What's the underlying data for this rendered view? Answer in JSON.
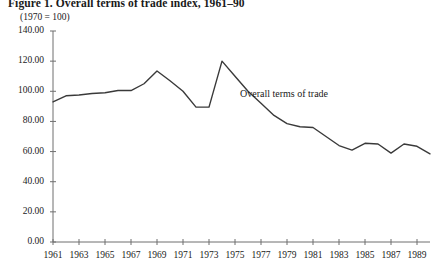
{
  "figure": {
    "title": "Figure 1.  Overall terms of trade index, 1961–90",
    "unit_note": "(1970 = 100)",
    "annotation": "Overall terms of trade",
    "line_color": "#3a3a3a",
    "axis_color": "#6f6f6f"
  },
  "chart_data": {
    "type": "line",
    "title": "Figure 1.  Overall terms of trade index, 1961–90",
    "subtitle": "(1970 = 100)",
    "xlabel": "",
    "ylabel": "",
    "ylim": [
      0,
      140
    ],
    "xlim": [
      1961,
      1990
    ],
    "grid": false,
    "legend": "inline-annotation",
    "legend_position": "center-right",
    "ytick_labels": [
      "0.00",
      "20.00",
      "40.00",
      "60.00",
      "80.00",
      "100.00",
      "120.00",
      "140.00"
    ],
    "ytick_values": [
      0,
      20,
      40,
      60,
      80,
      100,
      120,
      140
    ],
    "xtick_labels": [
      "1961",
      "1963",
      "1965",
      "1967",
      "1969",
      "1971",
      "1973",
      "1975",
      "1977",
      "1979",
      "1981",
      "1983",
      "1985",
      "1987",
      "1989"
    ],
    "xtick_values": [
      1961,
      1963,
      1965,
      1967,
      1969,
      1971,
      1973,
      1975,
      1977,
      1979,
      1981,
      1983,
      1985,
      1987,
      1989
    ],
    "x": [
      1961,
      1962,
      1963,
      1964,
      1965,
      1966,
      1967,
      1968,
      1969,
      1970,
      1971,
      1972,
      1973,
      1974,
      1975,
      1976,
      1977,
      1978,
      1979,
      1980,
      1981,
      1982,
      1983,
      1984,
      1985,
      1986,
      1987,
      1988,
      1989,
      1990
    ],
    "series": [
      {
        "name": "Overall terms of trade",
        "values": [
          93.0,
          97.0,
          97.5,
          98.5,
          99.0,
          100.5,
          100.5,
          105.0,
          113.5,
          107.0,
          100.0,
          89.5,
          89.5,
          120.0,
          110.0,
          100.0,
          92.0,
          84.0,
          78.5,
          76.5,
          76.0,
          70.0,
          64.0,
          61.0,
          65.5,
          65.0,
          59.0,
          65.0,
          63.5,
          58.5
        ]
      }
    ]
  }
}
